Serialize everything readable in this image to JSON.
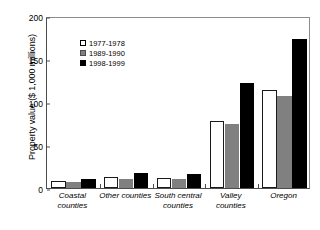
{
  "chart_data": {
    "type": "bar",
    "title": "",
    "subtitle": "",
    "xlabel": "",
    "ylabel": "Property value ($ 1,000 millions)",
    "categories": [
      "Coastal counties",
      "Other counties",
      "South central counties",
      "Valley counties",
      "Oregon"
    ],
    "series": [
      {
        "name": "1977-1978",
        "color": "#ffffff",
        "values": [
          8,
          13,
          12,
          78,
          114
        ]
      },
      {
        "name": "1989-1990",
        "color": "#808080",
        "values": [
          7,
          10,
          11,
          74,
          107
        ]
      },
      {
        "name": "1998-1999",
        "color": "#000000",
        "values": [
          11,
          17,
          16,
          122,
          173
        ]
      }
    ],
    "ylim": [
      0,
      200
    ],
    "yticks": [
      0,
      50,
      100,
      150,
      200
    ],
    "ytick_labels": [
      "0",
      "50",
      "100",
      "150",
      "200"
    ],
    "grid": false,
    "legend_position": "upper-left-inside",
    "annotations": []
  },
  "legend": {
    "entries": [
      {
        "label": "1977-1978"
      },
      {
        "label": "1989-1990"
      },
      {
        "label": "1998-1999"
      }
    ]
  },
  "axes": {
    "y_title": "Property value ($ 1,000 millions)",
    "x_categories": [
      {
        "line1": "Coastal counties",
        "line2": ""
      },
      {
        "line1": "Other counties",
        "line2": ""
      },
      {
        "line1": "South central",
        "line2": "counties"
      },
      {
        "line1": "Valley counties",
        "line2": ""
      },
      {
        "line1": "Oregon",
        "line2": ""
      }
    ]
  }
}
